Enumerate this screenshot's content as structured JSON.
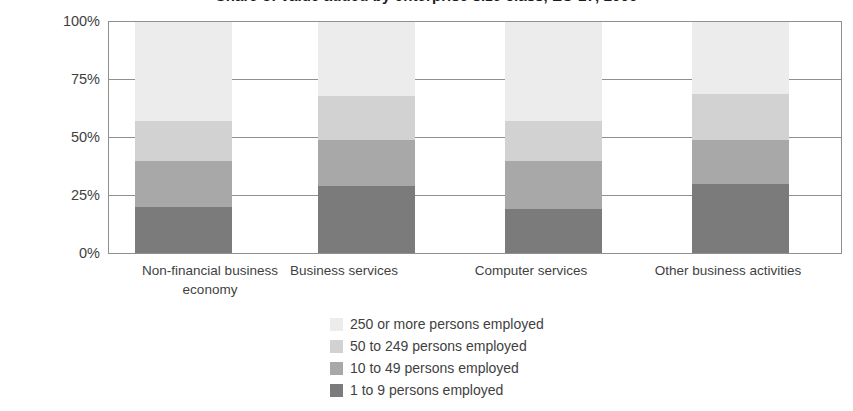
{
  "chart_data": {
    "type": "bar",
    "subtype": "stacked-100-percent",
    "title": "Share of value added by enterprise size class, EU-27, 2006",
    "xlabel": "",
    "ylabel": "",
    "ylim": [
      0,
      100
    ],
    "ytick_labels": [
      "0%",
      "25%",
      "50%",
      "75%",
      "100%"
    ],
    "ytick_values": [
      0,
      25,
      50,
      75,
      100
    ],
    "grid": true,
    "gridlines_at": [
      25,
      50,
      75,
      100
    ],
    "legend_position": "bottom-center",
    "stack_order_bottom_to_top": [
      "1 to 9 persons employed",
      "10 to 49 persons employed",
      "50 to 249 persons employed",
      "250 or more persons employed"
    ],
    "categories": [
      "Non-financial business economy",
      "Business services",
      "Computer services",
      "Other business activities"
    ],
    "category_label_lines": [
      [
        "Non-financial business",
        "economy"
      ],
      [
        "Business services"
      ],
      [
        "Computer services"
      ],
      [
        "Other business activities"
      ]
    ],
    "series": [
      {
        "name": "250 or more persons employed",
        "color": "#ececec",
        "values": [
          43,
          32,
          43,
          31
        ]
      },
      {
        "name": "50 to 249 persons employed",
        "color": "#d2d2d2",
        "values": [
          17,
          19,
          17,
          20
        ]
      },
      {
        "name": "10 to 49 persons employed",
        "color": "#a8a8a8",
        "values": [
          20,
          20,
          21,
          19
        ]
      },
      {
        "name": "1 to 9 persons employed",
        "color": "#7b7b7b",
        "values": [
          20,
          29,
          19,
          30
        ]
      }
    ],
    "legend_entries": [
      {
        "label": "250 or more persons employed",
        "color": "#ececec"
      },
      {
        "label": "50 to 249 persons employed",
        "color": "#d2d2d2"
      },
      {
        "label": "10 to 49 persons employed",
        "color": "#a8a8a8"
      },
      {
        "label": "1 to 9 persons employed",
        "color": "#7b7b7b"
      }
    ],
    "axis_color": "#8f8f8f",
    "text_color": "#3f3f3f",
    "background_color": "#ffffff"
  }
}
